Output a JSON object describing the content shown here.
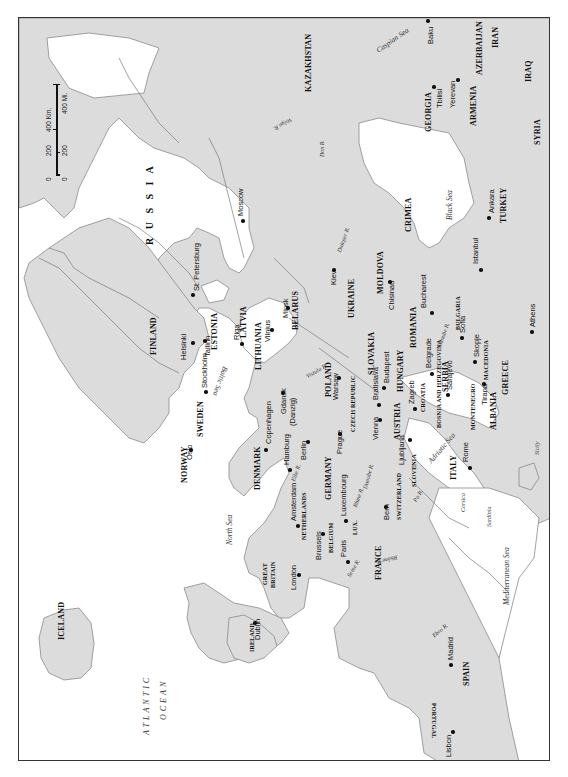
{
  "map": {
    "title": "",
    "orientation": "rotated 90 degrees counter-clockwise (north at left)",
    "colors": {
      "land": "#dcdcdc",
      "water": "#ffffff",
      "borders": "#6e6e6e",
      "frame": "#333333",
      "text": "#111111"
    },
    "scale_bar": {
      "km_labels": [
        "0",
        "200",
        "400 Km."
      ],
      "mi_labels": [
        "0",
        "200",
        "400 Mi."
      ]
    },
    "countries": {
      "russia": "R U S S I A",
      "kazakhstan": "KAZAKHSTAN",
      "georgia": "GEORGIA",
      "armenia": "ARMENIA",
      "azerbaijan": "AZERBAIJAN",
      "iran": "IRAN",
      "iraq": "IRAQ",
      "syria": "SYRIA",
      "turkey": "TURKEY",
      "crimea": "CRIMEA",
      "ukraine": "UKRAINE",
      "moldova": "MOLDOVA",
      "belarus": "BELARUS",
      "finland": "FINLAND",
      "estonia": "ESTONIA",
      "latvia": "LATVIA",
      "lithuania": "LITHUANIA",
      "romania": "ROMANIA",
      "bulgaria": "BULGARIA",
      "macedonia": "MACEDONIA",
      "greece": "GREECE",
      "albania": "ALBANIA",
      "montenegro": "MONTENEGRO",
      "serbia": "SERBIA",
      "bosnia": "BOSNIA AND HERZEGOVINA",
      "croatia": "CROATIA",
      "slovenia": "SLOVENIA",
      "hungary": "HUNGARY",
      "slovakia": "SLOVAKIA",
      "poland": "POLAND",
      "czech": "CZECH REPUBLIC",
      "austria": "AUSTRIA",
      "switzerland": "SWITZERLAND",
      "italy": "ITALY",
      "germany": "GERMANY",
      "lux": "LUX.",
      "netherlands": "NETHERLANDS",
      "belgium": "BELGIUM",
      "france": "FRANCE",
      "denmark": "DENMARK",
      "sweden": "SWEDEN",
      "norway": "NORWAY",
      "great_britain": "GREAT BRITAIN",
      "ireland": "IRELAND",
      "iceland": "ICELAND",
      "spain": "SPAIN",
      "portugal": "PORTUGAL"
    },
    "cities": {
      "baku": "Baku",
      "tbilisi": "Tbilisi",
      "yerevan": "Yerevan",
      "ankara": "Ankara",
      "istanbul": "Istanbul",
      "athens": "Athens",
      "moscow": "Moscow",
      "st_petersburg": "St. Petersburg",
      "kiev": "Kiev",
      "chisinau": "Chisinau",
      "bucharest": "Bucharest",
      "sofia": "Sofia",
      "skopje": "Skopje",
      "tirana": "Tirana",
      "belgrade": "Belgrade",
      "sarajevo": "Sarajevo",
      "zagreb": "Zagreb",
      "ljubljana": "Ljubljana",
      "budapest": "Budapest",
      "bratislava": "Bratislava",
      "vienna": "Vienna",
      "prague": "Prague",
      "warsaw": "Warsaw",
      "minsk": "Minsk",
      "vilnius": "Vilnius",
      "riga": "Riga",
      "tallinn": "Tallinn",
      "helsinki": "Helsinki",
      "stockholm": "Stockholm",
      "oslo": "Oslo",
      "copenhagen": "Copenhagen",
      "gdansk": "Gdansk",
      "danzig": "(Danzig)",
      "berlin": "Berlin",
      "hamburg": "Hamburg",
      "amsterdam": "Amsterdam",
      "brussels": "Brussels",
      "luxembourg": "Luxembourg",
      "paris": "Paris",
      "bern": "Bern",
      "rome": "Rome",
      "london": "London",
      "dublin": "Dublin",
      "madrid": "Madrid",
      "lisbon": "Lisbon"
    },
    "water": {
      "caspian": "Caspian Sea",
      "black_sea": "Black Sea",
      "baltic": "Baltic Sea",
      "north_sea": "North Sea",
      "adriatic": "Adriatic Sea",
      "mediterranean": "Mediterranean Sea",
      "atlantic_1": "ATLANTIC",
      "atlantic_2": "OCEAN",
      "volga": "Volga R.",
      "don": "Don R.",
      "dnieper": "Dnieper R.",
      "vistula": "Vistula R.",
      "danube_east": "Danube R.",
      "danube_west": "Danube R.",
      "elbe": "Elbe R.",
      "rhine": "Rhine R.",
      "po": "Po R.",
      "rhone": "Rhône R.",
      "seine": "Seine R.",
      "ebro": "Ebro R."
    },
    "islands": {
      "corsica": "Corsica",
      "sardinia": "Sardinia",
      "sicily": "Sicily"
    }
  }
}
